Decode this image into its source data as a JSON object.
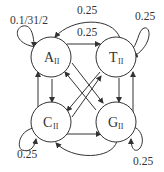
{
  "diagram": {
    "type": "state-transition",
    "nodes": [
      {
        "id": "A",
        "letter": "A",
        "subscript": "II"
      },
      {
        "id": "T",
        "letter": "T",
        "subscript": "II"
      },
      {
        "id": "C",
        "letter": "C",
        "subscript": "II"
      },
      {
        "id": "G",
        "letter": "G",
        "subscript": "II"
      }
    ],
    "edge_labels": {
      "a_self": "0.1/31/2",
      "t_to_a": "0.25",
      "a_to_t": "0.25",
      "t_self": "0.25",
      "c_self": "0.25",
      "g_self": "0.25"
    },
    "edges": [
      {
        "from": "A",
        "to": "A",
        "label": "0.1/31/2"
      },
      {
        "from": "T",
        "to": "A",
        "label": "0.25"
      },
      {
        "from": "A",
        "to": "T",
        "label": "0.25"
      },
      {
        "from": "T",
        "to": "T",
        "label": "0.25"
      },
      {
        "from": "C",
        "to": "C",
        "label": "0.25"
      },
      {
        "from": "G",
        "to": "G",
        "label": "0.25"
      },
      {
        "from": "A",
        "to": "C"
      },
      {
        "from": "C",
        "to": "A"
      },
      {
        "from": "T",
        "to": "G"
      },
      {
        "from": "G",
        "to": "T"
      },
      {
        "from": "A",
        "to": "G"
      },
      {
        "from": "G",
        "to": "A"
      },
      {
        "from": "T",
        "to": "C"
      },
      {
        "from": "C",
        "to": "T"
      },
      {
        "from": "C",
        "to": "G"
      },
      {
        "from": "G",
        "to": "C"
      }
    ]
  }
}
